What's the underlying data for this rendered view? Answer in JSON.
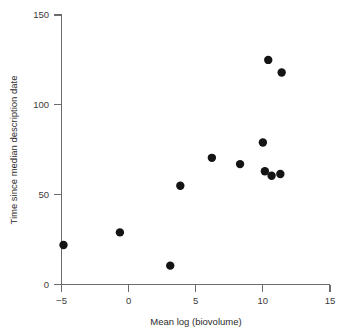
{
  "chart_data": {
    "type": "scatter",
    "title": "",
    "xlabel": "Mean log (biovolume)",
    "ylabel": "Time since median description date",
    "xlim": [
      -5,
      15
    ],
    "ylim": [
      0,
      150
    ],
    "xticks": [
      -5,
      0,
      5,
      10,
      15
    ],
    "xtick_labels": [
      "−5",
      "0",
      "5",
      "10",
      "15"
    ],
    "yticks": [
      0,
      50,
      100,
      150
    ],
    "ytick_labels": [
      "0",
      "50",
      "100",
      "150"
    ],
    "grid": false,
    "legend": null,
    "marker": {
      "shape": "circle",
      "color": "#141414",
      "size_px": 4.2
    },
    "points": [
      {
        "x": -4.85,
        "y": 22
      },
      {
        "x": -0.65,
        "y": 29
      },
      {
        "x": 3.1,
        "y": 10.5
      },
      {
        "x": 3.85,
        "y": 55
      },
      {
        "x": 6.2,
        "y": 70.5
      },
      {
        "x": 8.3,
        "y": 67
      },
      {
        "x": 10.0,
        "y": 79
      },
      {
        "x": 10.15,
        "y": 63
      },
      {
        "x": 10.4,
        "y": 125
      },
      {
        "x": 10.65,
        "y": 60.5
      },
      {
        "x": 11.3,
        "y": 61.5
      },
      {
        "x": 11.4,
        "y": 118
      }
    ]
  },
  "axes": {
    "x_title": "Mean log (biovolume)",
    "y_title": "Time since median description date"
  }
}
